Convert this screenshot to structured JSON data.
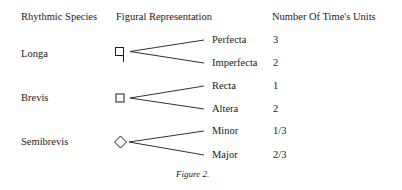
{
  "header": {
    "species": "Rhythmic Species",
    "figural": "Figural Representation",
    "units": "Number Of Time's Units"
  },
  "rows": [
    {
      "species": "Longa",
      "symbol": "square-with-stem-icon",
      "branches": [
        {
          "label": "Perfecta",
          "units": "3"
        },
        {
          "label": "Imperfecta",
          "units": "2"
        }
      ]
    },
    {
      "species": "Brevis",
      "symbol": "square-icon",
      "branches": [
        {
          "label": "Recta",
          "units": "1"
        },
        {
          "label": "Altera",
          "units": "2"
        }
      ]
    },
    {
      "species": "Semibrevis",
      "symbol": "diamond-icon",
      "branches": [
        {
          "label": "Minor",
          "units": "1/3"
        },
        {
          "label": "Major",
          "units": "2/3"
        }
      ]
    }
  ],
  "caption": "Figure 2."
}
